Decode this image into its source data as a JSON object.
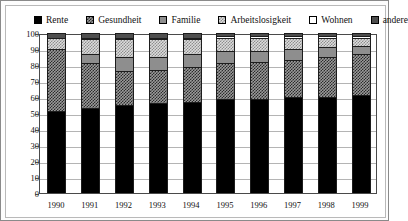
{
  "chart_data": {
    "type": "bar",
    "title": "",
    "subtitle": "",
    "xlabel": "",
    "ylabel": "",
    "stacked": true,
    "percentage": true,
    "grid": true,
    "legend_position": "top",
    "ylim": [
      0,
      100
    ],
    "ytick_labels": [
      "100",
      "90",
      "80",
      "70",
      "60",
      "50",
      "40",
      "30",
      "20",
      "10",
      "0"
    ],
    "yticks": [
      100,
      90,
      80,
      70,
      60,
      50,
      40,
      30,
      20,
      10,
      0
    ],
    "categories": [
      "1990",
      "1991",
      "1992",
      "1993",
      "1994",
      "1995",
      "1996",
      "1997",
      "1998",
      "1999"
    ],
    "series": [
      {
        "name": "Rente",
        "fill": "f-rente",
        "color": "#000000",
        "values": [
          51,
          53,
          55,
          56,
          57,
          59,
          59,
          60,
          60,
          61
        ]
      },
      {
        "name": "Gesundheit",
        "fill": "f-gesundheit",
        "color": "#9a9a9a",
        "values": [
          39,
          28,
          21,
          21,
          22,
          22,
          23,
          23,
          25,
          26
        ]
      },
      {
        "name": "Familie",
        "fill": "f-familie",
        "color": "#8e8e8e",
        "values": [
          0,
          6,
          9,
          8,
          8,
          8,
          7,
          7,
          6,
          5
        ]
      },
      {
        "name": "Arbeitslosigkeit",
        "fill": "f-arbeit",
        "color": "#dcdcdc",
        "values": [
          7,
          9,
          11,
          11,
          9,
          8,
          8,
          7,
          6,
          5
        ]
      },
      {
        "name": "Wohnen",
        "fill": "f-wohnen",
        "color": "#ffffff",
        "values": [
          0,
          1,
          1,
          1,
          1,
          1,
          1,
          1,
          1,
          1
        ]
      },
      {
        "name": "andere",
        "fill": "f-andere",
        "color": "#4e4e4e",
        "values": [
          3,
          3,
          3,
          3,
          3,
          2,
          2,
          2,
          2,
          2
        ]
      }
    ]
  },
  "legend": {
    "items": [
      {
        "label": "Rente",
        "swatch": "f-rente"
      },
      {
        "label": "Gesundheit",
        "swatch": "f-gesundheit"
      },
      {
        "label": "Familie",
        "swatch": "f-familie"
      },
      {
        "label": "Arbeitslosigkeit",
        "swatch": "f-arbeit"
      },
      {
        "label": "Wohnen",
        "swatch": "f-wohnen"
      },
      {
        "label": "andere",
        "swatch": "f-andere"
      }
    ]
  }
}
